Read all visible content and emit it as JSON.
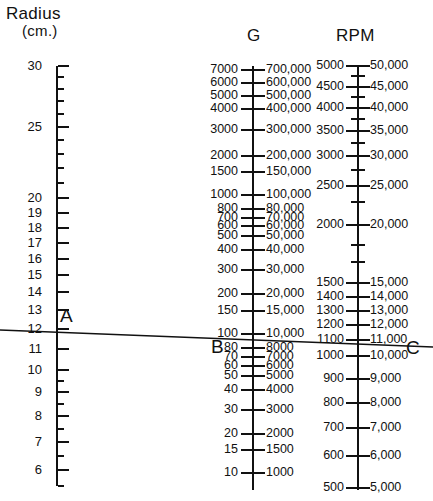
{
  "headers": {
    "radius": "Radius",
    "radius_unit": "(cm.)",
    "g": "G",
    "rpm": "RPM"
  },
  "point_labels": {
    "a": "A",
    "b": "B",
    "c": "C"
  },
  "chart_data": {
    "type": "line",
    "subtitle": "Three-scale alignment nomogram (nomograph) for relative centrifugal force",
    "xlabel": "",
    "ylabel": "",
    "grid": false,
    "legend": "none",
    "scales": [
      {
        "name": "Radius",
        "axis_label": "Radius",
        "axis_unit": "(cm.)",
        "scale_type": "log",
        "direction": "decreasing-downward",
        "range": [
          3,
          30
        ],
        "x_px": 56,
        "ticks": [
          {
            "value": 30,
            "label": "30",
            "y": 66,
            "major": true
          },
          {
            "value": 29,
            "label": "",
            "y": 77,
            "major": false
          },
          {
            "value": 28,
            "label": "",
            "y": 89,
            "major": false
          },
          {
            "value": 27,
            "label": "",
            "y": 101,
            "major": false
          },
          {
            "value": 26,
            "label": "",
            "y": 114,
            "major": false
          },
          {
            "value": 25,
            "label": "25",
            "y": 127,
            "major": true
          },
          {
            "value": 24,
            "label": "",
            "y": 140,
            "major": false
          },
          {
            "value": 23,
            "label": "",
            "y": 154,
            "major": false
          },
          {
            "value": 22,
            "label": "",
            "y": 168,
            "major": false
          },
          {
            "value": 21,
            "label": "",
            "y": 183,
            "major": false
          },
          {
            "value": 20,
            "label": "20",
            "y": 198,
            "major": true
          },
          {
            "value": 19,
            "label": "19",
            "y": 213,
            "major": true
          },
          {
            "value": 18,
            "label": "18",
            "y": 228,
            "major": true
          },
          {
            "value": 17,
            "label": "17",
            "y": 243,
            "major": true
          },
          {
            "value": 16,
            "label": "16",
            "y": 259,
            "major": true
          },
          {
            "value": 15,
            "label": "15",
            "y": 275,
            "major": true
          },
          {
            "value": 14,
            "label": "14",
            "y": 292,
            "major": true
          },
          {
            "value": 13,
            "label": "13",
            "y": 310,
            "major": true
          },
          {
            "value": 12,
            "label": "12",
            "y": 329,
            "major": true
          },
          {
            "value": 11,
            "label": "11",
            "y": 349,
            "major": true
          },
          {
            "value": 10,
            "label": "10",
            "y": 370,
            "major": true
          },
          {
            "value": 9.5,
            "label": "",
            "y": 381,
            "major": false
          },
          {
            "value": 9,
            "label": "9",
            "y": 392,
            "major": true
          },
          {
            "value": 8.5,
            "label": "",
            "y": 404,
            "major": false
          },
          {
            "value": 8,
            "label": "8",
            "y": 416,
            "major": true
          },
          {
            "value": 7.5,
            "label": "",
            "y": 429,
            "major": false
          },
          {
            "value": 7,
            "label": "7",
            "y": 442,
            "major": true
          },
          {
            "value": 6.5,
            "label": "",
            "y": 456,
            "major": false
          },
          {
            "value": 6,
            "label": "6",
            "y": 470,
            "major": true
          },
          {
            "value": 5.5,
            "label": "",
            "y": 486,
            "major": false
          },
          {
            "value": 5,
            "label": "5",
            "y": 502,
            "major": true
          }
        ]
      },
      {
        "name": "G",
        "axis_label": "G",
        "scale_type": "log",
        "direction": "decreasing-downward",
        "range_left": [
          10,
          7000
        ],
        "range_right": [
          1000,
          700000
        ],
        "x_px": 252,
        "note": "left column is G/100 shorthand; right column is full G value",
        "ticks": [
          {
            "left": "7000",
            "right": "700,000",
            "y": 70,
            "major": true
          },
          {
            "left": "6000",
            "right": "600,000",
            "y": 83,
            "major": true
          },
          {
            "left": "5000",
            "right": "500,000",
            "y": 96,
            "major": true
          },
          {
            "left": "4000",
            "right": "400,000",
            "y": 109,
            "major": true
          },
          {
            "left": "3000",
            "right": "300,000",
            "y": 130,
            "major": true
          },
          {
            "left": "2000",
            "right": "200,000",
            "y": 156,
            "major": true
          },
          {
            "left": "1500",
            "right": "150,000",
            "y": 172,
            "major": true
          },
          {
            "left": "1000",
            "right": "100,000",
            "y": 195,
            "major": true
          },
          {
            "left": "800",
            "right": "80,000",
            "y": 209,
            "major": true
          },
          {
            "left": "700",
            "right": "70,000",
            "y": 218,
            "major": true
          },
          {
            "left": "600",
            "right": "60,000",
            "y": 226,
            "major": true
          },
          {
            "left": "500",
            "right": "50,000",
            "y": 236,
            "major": true
          },
          {
            "left": "400",
            "right": "40,000",
            "y": 250,
            "major": true
          },
          {
            "left": "300",
            "right": "30,000",
            "y": 270,
            "major": true
          },
          {
            "left": "200",
            "right": "20,000",
            "y": 294,
            "major": true
          },
          {
            "left": "150",
            "right": "15,000",
            "y": 311,
            "major": true
          },
          {
            "left": "100",
            "right": "10,000",
            "y": 334,
            "major": true
          },
          {
            "left": "80",
            "right": "8000",
            "y": 348,
            "major": true
          },
          {
            "left": "70",
            "right": "7000",
            "y": 357,
            "major": true
          },
          {
            "left": "60",
            "right": "6000",
            "y": 366,
            "major": true
          },
          {
            "left": "50",
            "right": "5000",
            "y": 376,
            "major": true
          },
          {
            "left": "40",
            "right": "4000",
            "y": 390,
            "major": true
          },
          {
            "left": "30",
            "right": "3000",
            "y": 410,
            "major": true
          },
          {
            "left": "20",
            "right": "2000",
            "y": 434,
            "major": true
          },
          {
            "left": "15",
            "right": "1500",
            "y": 450,
            "major": true
          },
          {
            "left": "10",
            "right": "1000",
            "y": 473,
            "major": true
          }
        ]
      },
      {
        "name": "RPM",
        "axis_label": "RPM",
        "scale_type": "log",
        "direction": "decreasing-downward",
        "range_left": [
          500,
          5000
        ],
        "range_right": [
          5000,
          50000
        ],
        "x_px": 357,
        "note": "left column is RPM/10 shorthand; right column is full RPM value",
        "ticks": [
          {
            "left": "5000",
            "right": "50,000",
            "y": 66,
            "major": true
          },
          {
            "left": "",
            "right": "",
            "y": 76,
            "major": false
          },
          {
            "left": "4500",
            "right": "45,000",
            "y": 87,
            "major": true
          },
          {
            "left": "",
            "right": "",
            "y": 97,
            "major": false
          },
          {
            "left": "4000",
            "right": "40,000",
            "y": 108,
            "major": true
          },
          {
            "left": "",
            "right": "",
            "y": 119,
            "major": false
          },
          {
            "left": "3500",
            "right": "35,000",
            "y": 131,
            "major": true
          },
          {
            "left": "",
            "right": "",
            "y": 143,
            "major": false
          },
          {
            "left": "3000",
            "right": "30,000",
            "y": 156,
            "major": true
          },
          {
            "left": "",
            "right": "",
            "y": 170,
            "major": false
          },
          {
            "left": "2500",
            "right": "25,000",
            "y": 186,
            "major": true
          },
          {
            "left": "",
            "right": "",
            "y": 202,
            "major": false
          },
          {
            "left": "2000",
            "right": "20,000",
            "y": 225,
            "major": true
          },
          {
            "left": "",
            "right": "",
            "y": 245,
            "major": false
          },
          {
            "left": "",
            "right": "",
            "y": 262,
            "major": false
          },
          {
            "left": "1500",
            "right": "15,000",
            "y": 283,
            "major": true
          },
          {
            "left": "1400",
            "right": "14,000",
            "y": 297,
            "major": true
          },
          {
            "left": "1300",
            "right": "13,000",
            "y": 311,
            "major": true
          },
          {
            "left": "1200",
            "right": "12,000",
            "y": 325,
            "major": true
          },
          {
            "left": "1100",
            "right": "11,000",
            "y": 340,
            "major": true
          },
          {
            "left": "1000",
            "right": "10,000",
            "y": 356,
            "major": true
          },
          {
            "left": "900",
            "right": "9,000",
            "y": 379,
            "major": true
          },
          {
            "left": "800",
            "right": "8,000",
            "y": 403,
            "major": true
          },
          {
            "left": "700",
            "right": "7,000",
            "y": 428,
            "major": true
          },
          {
            "left": "600",
            "right": "6,000",
            "y": 456,
            "major": true
          },
          {
            "left": "500",
            "right": "5,000",
            "y": 488,
            "major": true
          }
        ]
      }
    ],
    "isopleth": {
      "label": "alignment line A-B-C",
      "points": [
        {
          "name": "A",
          "scale": "Radius",
          "value": 7,
          "x": 56,
          "y": 330
        },
        {
          "name": "B",
          "scale": "G",
          "value": 10000,
          "value_short": 100,
          "x": 252,
          "y": 341
        },
        {
          "name": "C",
          "scale": "RPM",
          "value": 11000,
          "value_short": 1100,
          "x": 357,
          "y": 345
        }
      ],
      "x_start": 0,
      "y_start": 330,
      "x_end": 433,
      "y_end": 347,
      "color": "#111111"
    }
  }
}
